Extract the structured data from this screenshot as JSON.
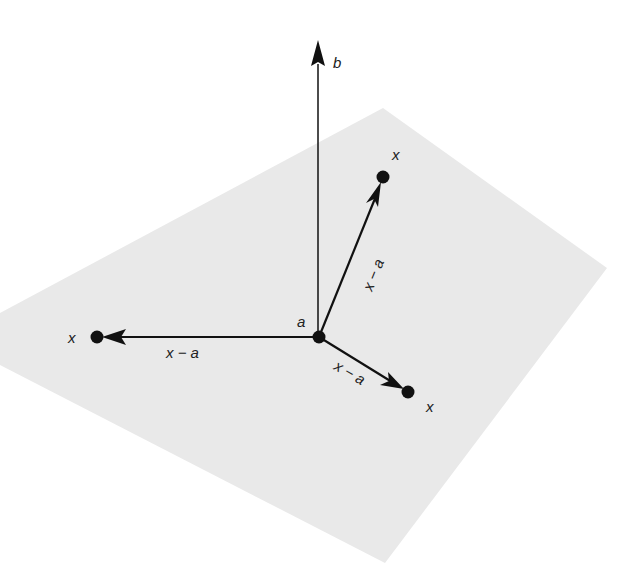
{
  "diagram": {
    "colors": {
      "plane": "#e9e9e9",
      "ink": "#111111",
      "background": "#ffffff"
    },
    "plane": {
      "points": "0,313 383,108 607,268 385,563 0,365"
    },
    "origin": {
      "label": "a",
      "x": 319,
      "y": 337
    },
    "normal_vector": {
      "label": "b",
      "tip_x": 318,
      "tip_y": 40
    },
    "vectors": [
      {
        "id": "upper-right",
        "end_label": "x",
        "vector_label": "x − a",
        "x": 383,
        "y": 177
      },
      {
        "id": "left",
        "end_label": "x",
        "vector_label": "x − a",
        "x": 97,
        "y": 337
      },
      {
        "id": "lower-right",
        "end_label": "x",
        "vector_label": "x − a",
        "x": 408,
        "y": 392
      }
    ]
  }
}
